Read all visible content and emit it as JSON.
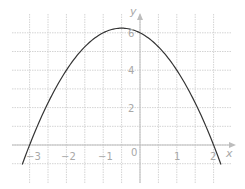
{
  "chart_data": {
    "type": "line",
    "title": "",
    "xlabel": "x",
    "ylabel": "y",
    "function": "y = -x^2 - x + 6",
    "xlim": [
      -3.25,
      2.5
    ],
    "ylim": [
      -1,
      7
    ],
    "grid": true,
    "grid_step_x": 0.5,
    "grid_step_y": 1,
    "x_ticks": [
      {
        "value": -3,
        "label": "-3"
      },
      {
        "value": -2,
        "label": "−2"
      },
      {
        "value": -1,
        "label": "−1"
      },
      {
        "value": 0,
        "label": "0"
      },
      {
        "value": 1,
        "label": "1"
      },
      {
        "value": 2,
        "label": "2"
      }
    ],
    "y_ticks": [
      {
        "value": 2,
        "label": "2"
      },
      {
        "value": 4,
        "label": "4"
      },
      {
        "value": 6,
        "label": "6"
      }
    ],
    "series": [
      {
        "name": "parabola",
        "x": [
          -3.2,
          -3,
          -2,
          -1,
          -0.5,
          0,
          1,
          2,
          2.2
        ],
        "values": [
          -1.04,
          0,
          4,
          6,
          6.25,
          6,
          4,
          0,
          -1.04
        ],
        "color": "#333333"
      }
    ]
  },
  "labels": {
    "x_axis": "x",
    "y_axis": "y",
    "origin": "0",
    "xm3": "−3",
    "xm2": "−2",
    "xm1": "−1",
    "x1": "1",
    "x2": "2",
    "y2": "2",
    "y4": "4",
    "y6": "6"
  }
}
